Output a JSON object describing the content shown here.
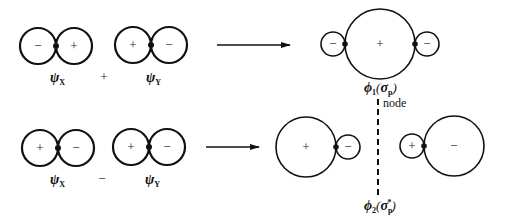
{
  "diagram": {
    "colors": {
      "stroke": "#111111",
      "background": "#ffffff"
    },
    "top_row": {
      "orbital_x": {
        "left_lobe_sign": "−",
        "right_lobe_sign": "+",
        "label_symbol": "ψ",
        "label_sub": "X"
      },
      "operator": "+",
      "orbital_y": {
        "left_lobe_sign": "+",
        "right_lobe_sign": "−",
        "label_symbol": "ψ",
        "label_sub": "Y"
      },
      "arrow": "right-arrow",
      "result": {
        "left_small_sign": "−",
        "center_large_sign": "+",
        "right_small_sign": "−",
        "label_symbol": "ϕ",
        "label_sub": "1",
        "label_paren_open": "(",
        "label_sigma": "σ",
        "label_sigma_sub": "p",
        "label_paren_close": ")"
      }
    },
    "node": {
      "label": "node"
    },
    "bottom_row": {
      "orbital_x": {
        "left_lobe_sign": "+",
        "right_lobe_sign": "−",
        "label_symbol": "ψ",
        "label_sub": "X"
      },
      "operator": "−",
      "orbital_y": {
        "left_lobe_sign": "+",
        "right_lobe_sign": "−",
        "label_symbol": "ψ",
        "label_sub": "Y"
      },
      "arrow": "right-arrow",
      "result": {
        "left_large_sign": "+",
        "left_small_sign": "−",
        "right_small_sign": "+",
        "right_large_sign": "−",
        "label_symbol": "ϕ",
        "label_sub": "2",
        "label_paren_open": "(",
        "label_sigma": "σ",
        "label_sigma_sub": "p",
        "label_sigma_sup": "*",
        "label_paren_close": ")"
      }
    }
  }
}
